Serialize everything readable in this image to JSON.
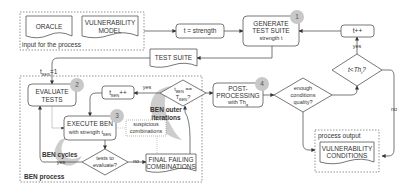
{
  "input_group": {
    "label": "input for the process",
    "oracle": "ORACLE",
    "vulnerability_model_l1": "VULNERABILITY",
    "vulnerability_model_l2": "MODEL"
  },
  "nodes": {
    "strength": "t = strength",
    "generate_l1": "GENERATE",
    "generate_l2": "TEST SUITE",
    "generate_l3": "strength t",
    "test_suite": "TEST SUITE",
    "t_increment": "t++",
    "t_less_th": "t<Th",
    "t_less_th_sub": "t",
    "t_less_th_q": "?",
    "evaluate_l1": "EVALUATE",
    "evaluate_l2": "TESTS",
    "tben_increment": "t",
    "tben_increment_sub": "BEN",
    "tben_increment_op": "++",
    "tben_check_l1": "t",
    "tben_check_sub": "BEN",
    "tben_check_op": " ==",
    "tben_check_l2": "T",
    "tben_check_l2_sub": "BEN",
    "tben_check_q": "?",
    "execute_l1": "EXECUTE BEN",
    "execute_l2": "with strength t",
    "execute_sub": "BEN",
    "suspicious_l1": "suspicious",
    "suspicious_l2": "combinations",
    "tests_eval_l1": "tests to",
    "tests_eval_l2": "evaluate?",
    "final_l1": "FINAL FAILING",
    "final_l2": "COMBINATIONS",
    "post_l1": "POST-",
    "post_l2": "PROCESSING",
    "post_l3": "with Th",
    "post_sub": "q",
    "enough_l1": "enough",
    "enough_l2": "conditions",
    "enough_l3": "quality?",
    "vuln_cond_l1": "VULNERABILITY",
    "vuln_cond_l2": "CONDITIONS"
  },
  "edge_labels": {
    "tben_init": "t",
    "tben_init_sub": "BEN",
    "tben_init_val": "=1",
    "yes_top": "yes",
    "yes_outer": "yes",
    "yes_cycles": "yes",
    "no_tests": "no",
    "no_right": "no"
  },
  "groups": {
    "ben_process": "BEN process",
    "ben_cycles": "BEN cycles",
    "ben_outer_l1": "BEN outer",
    "ben_outer_l2": "iterations",
    "process_output": "process output"
  },
  "badges": [
    "1",
    "2",
    "3",
    "4"
  ],
  "colors": {
    "stroke": "#444444",
    "dotted": "#777777",
    "badge": "#c8c8c8",
    "swirl": "#c8c8c8"
  }
}
